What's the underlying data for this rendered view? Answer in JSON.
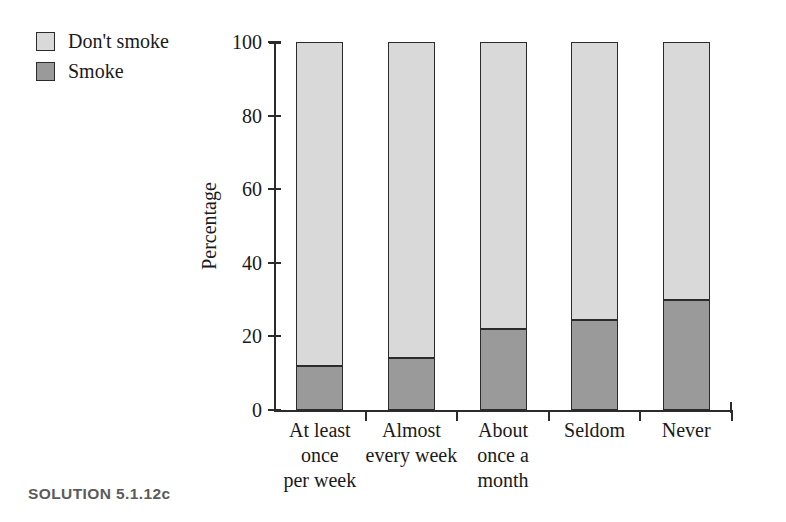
{
  "caption": "SOLUTION 5.1.12c",
  "colors": {
    "dont_smoke": "#d9d9d9",
    "smoke": "#9a9a9a",
    "outline": "#2b2b2b",
    "text": "#1a1a1a",
    "caption": "#5b5b5b"
  },
  "legend": {
    "position": "top-left",
    "items": [
      {
        "label": "Don't smoke",
        "color": "#d9d9d9"
      },
      {
        "label": "Smoke",
        "color": "#9a9a9a"
      }
    ]
  },
  "axes": {
    "ylabel": "Percentage",
    "xlabel": "",
    "yticks": [
      "0",
      "20",
      "40",
      "60",
      "80",
      "100"
    ],
    "ymin": 0,
    "ymax": 100
  },
  "categories_display": [
    [
      "At least",
      "once",
      "per week"
    ],
    [
      "Almost",
      "every week"
    ],
    [
      "About",
      "once a",
      "month"
    ],
    [
      "Seldom"
    ],
    [
      "Never"
    ]
  ],
  "chart_data": {
    "type": "bar",
    "subtype": "stacked-bar-100",
    "title": "",
    "subtitle": "",
    "xlabel": "",
    "ylabel": "Percentage",
    "ylim": [
      0,
      100
    ],
    "yticks": [
      0,
      20,
      40,
      60,
      80,
      100
    ],
    "grid": false,
    "legend_position": "top-left",
    "categories": [
      "At least once per week",
      "Almost every week",
      "About once a month",
      "Seldom",
      "Never"
    ],
    "series": [
      {
        "name": "Smoke",
        "color": "#9a9a9a",
        "values": [
          12,
          14,
          22,
          24.5,
          30
        ]
      },
      {
        "name": "Don't smoke",
        "color": "#d9d9d9",
        "values": [
          88,
          86,
          78,
          75.5,
          70
        ]
      }
    ],
    "stack_order": [
      "Smoke",
      "Don't smoke"
    ],
    "annotations": [
      "SOLUTION 5.1.12c"
    ]
  }
}
